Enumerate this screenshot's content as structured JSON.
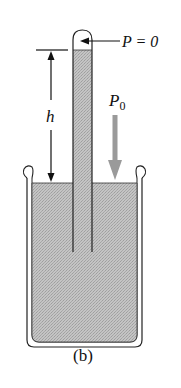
{
  "figure": {
    "subfigure_label": "(b)"
  },
  "labels": {
    "vacuum_pressure": "P = 0",
    "atmospheric_pressure_symbol": "P",
    "atmospheric_pressure_subscript": "0",
    "height": "h"
  },
  "colors": {
    "liquid_fill": "#b9b9b9",
    "outline": "#222222",
    "pressure_arrow": "#9a9a9a",
    "background": "#ffffff"
  }
}
